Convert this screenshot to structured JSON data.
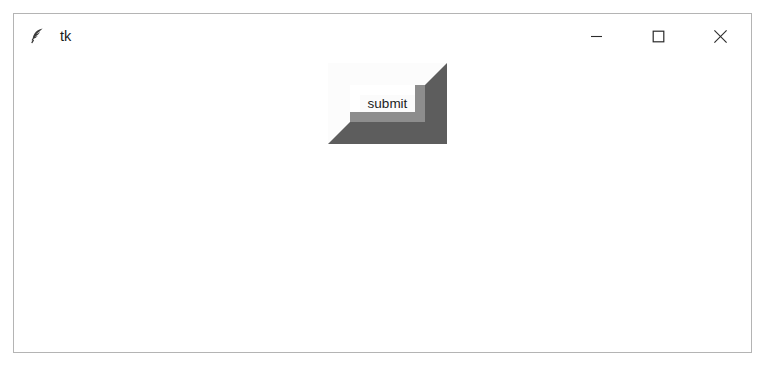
{
  "window": {
    "title": "tk",
    "icon": "feather-quill-icon",
    "background_color": "#ffffff",
    "border_color": "#b4b4b4"
  },
  "titlebar": {
    "controls": [
      {
        "name": "minimize",
        "label": "—",
        "icon": "minimize-icon"
      },
      {
        "name": "maximize",
        "label": "☐",
        "icon": "maximize-icon"
      },
      {
        "name": "close",
        "label": "✕",
        "icon": "close-icon"
      }
    ]
  },
  "client": {
    "submit_button": {
      "label": "submit",
      "relief": "raised",
      "text_color": "#1c1c1c",
      "face_color": "#fbfbfb",
      "highlight_color": "#ffffff",
      "shadow_inner_color": "#8d8d8d",
      "shadow_outer_color": "#5d5d5d"
    }
  }
}
